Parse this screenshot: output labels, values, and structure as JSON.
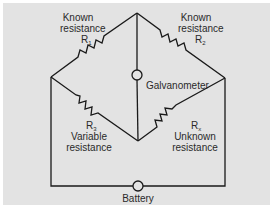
{
  "diagram": {
    "type": "Wheatstone bridge circuit",
    "colors": {
      "background": "#e3e3e3",
      "border": "#ffffff",
      "wire": "#1a1a1a",
      "text": "#2a2a2a"
    },
    "resistors": [
      {
        "id": "R1",
        "symbol": "R",
        "subscript": "1",
        "label_lines": [
          "Known",
          "resistance"
        ],
        "position": "top-left arm"
      },
      {
        "id": "R2",
        "symbol": "R",
        "subscript": "2",
        "label_lines": [
          "Known",
          "resistance"
        ],
        "position": "top-right arm"
      },
      {
        "id": "R3",
        "symbol": "R",
        "subscript": "3",
        "label_lines": [
          "Variable",
          "resistance"
        ],
        "position": "bottom-left arm"
      },
      {
        "id": "Rx",
        "symbol": "R",
        "subscript": "x",
        "label_lines": [
          "Unknown",
          "resistance"
        ],
        "position": "bottom-right arm"
      }
    ],
    "galvanometer": {
      "label": "Galvanometer",
      "position": "center vertical branch"
    },
    "battery": {
      "label": "Battery",
      "position": "bottom wire"
    }
  }
}
